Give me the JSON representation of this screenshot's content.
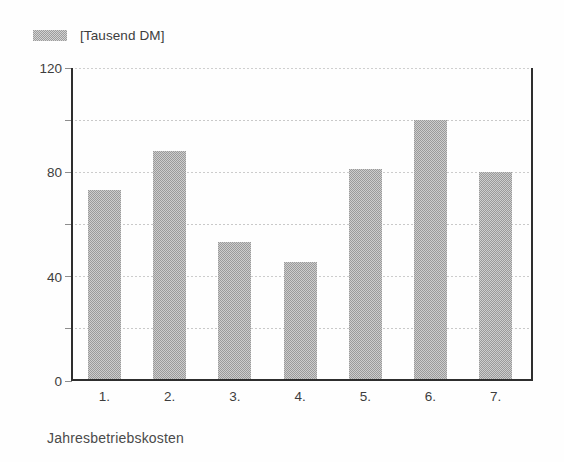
{
  "chart_data": {
    "type": "bar",
    "title": "",
    "subtitle": "",
    "xlabel": "Jahresbetriebskosten",
    "ylabel": "",
    "legend": [
      {
        "name": "[Tausend DM]",
        "swatch": "#9a9a9a",
        "pattern": "dithered-gray"
      }
    ],
    "legend_position": "top-left",
    "categories": [
      "1.",
      "2.",
      "3.",
      "4.",
      "5.",
      "6.",
      "7."
    ],
    "values": [
      73,
      88,
      53,
      45,
      81,
      100,
      80
    ],
    "ylim": [
      0,
      120
    ],
    "yticks": [
      0,
      20,
      40,
      60,
      80,
      100,
      120
    ],
    "ytick_labels": [
      "0",
      "",
      "40",
      "",
      "80",
      "",
      "120"
    ],
    "ytick_labels_major": [
      "0",
      "40",
      "80",
      "120"
    ],
    "grid": true,
    "grid_axis": "y",
    "grid_style": "dotted",
    "bar_color": "#9a9a9a",
    "axis_color": "#2e2e2e",
    "grid_color": "#c9c9c9",
    "text_color": "#3d3d3d"
  },
  "legend": {
    "label": "[Tausend DM]"
  },
  "axis": {
    "x_title": "Jahresbetriebskosten"
  }
}
